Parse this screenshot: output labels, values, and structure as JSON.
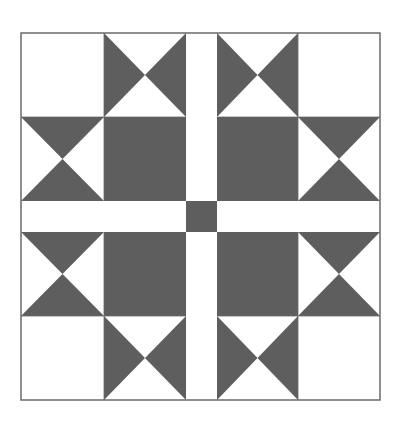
{
  "figure": {
    "title": "",
    "kind": "quilt-block",
    "colors": {
      "background": "#ffffff",
      "fill_dark": "#5e5e5e",
      "fill_light": "#ffffff",
      "outline": "#6a6a6a"
    },
    "bounds": {
      "x": 21,
      "y": 33,
      "width": 359,
      "height": 367
    },
    "grid": {
      "col_edges": [
        21,
        104,
        186,
        217,
        298,
        380
      ],
      "row_edges": [
        33,
        117,
        201,
        232,
        316,
        400
      ]
    },
    "cells": [
      {
        "row": 0,
        "col": 0,
        "type": "plain-light"
      },
      {
        "row": 0,
        "col": 1,
        "type": "bowtie-horizontal"
      },
      {
        "row": 0,
        "col": 2,
        "type": "sash-light"
      },
      {
        "row": 0,
        "col": 3,
        "type": "bowtie-horizontal"
      },
      {
        "row": 0,
        "col": 4,
        "type": "plain-light"
      },
      {
        "row": 1,
        "col": 0,
        "type": "hourglass-vertical"
      },
      {
        "row": 1,
        "col": 1,
        "type": "plain-dark"
      },
      {
        "row": 1,
        "col": 2,
        "type": "sash-light"
      },
      {
        "row": 1,
        "col": 3,
        "type": "plain-dark"
      },
      {
        "row": 1,
        "col": 4,
        "type": "hourglass-vertical"
      },
      {
        "row": 2,
        "col": 0,
        "type": "sash-light"
      },
      {
        "row": 2,
        "col": 1,
        "type": "sash-light"
      },
      {
        "row": 2,
        "col": 2,
        "type": "center-dark"
      },
      {
        "row": 2,
        "col": 3,
        "type": "sash-light"
      },
      {
        "row": 2,
        "col": 4,
        "type": "sash-light"
      },
      {
        "row": 3,
        "col": 0,
        "type": "hourglass-vertical"
      },
      {
        "row": 3,
        "col": 1,
        "type": "plain-dark"
      },
      {
        "row": 3,
        "col": 2,
        "type": "sash-light"
      },
      {
        "row": 3,
        "col": 3,
        "type": "plain-dark"
      },
      {
        "row": 3,
        "col": 4,
        "type": "hourglass-vertical"
      },
      {
        "row": 4,
        "col": 0,
        "type": "plain-light"
      },
      {
        "row": 4,
        "col": 1,
        "type": "bowtie-horizontal"
      },
      {
        "row": 4,
        "col": 2,
        "type": "sash-light"
      },
      {
        "row": 4,
        "col": 3,
        "type": "bowtie-horizontal"
      },
      {
        "row": 4,
        "col": 4,
        "type": "plain-light"
      }
    ]
  }
}
